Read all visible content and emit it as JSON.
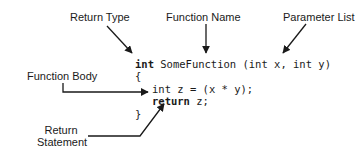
{
  "labels": {
    "return_type": "Return Type",
    "function_name": "Function Name",
    "parameter_list": "Parameter List",
    "function_body": "Function Body",
    "return_statement_line1": "Return",
    "return_statement_line2": "Statement"
  },
  "code": {
    "line1_keyword": "int",
    "line1_rest": " SomeFunction (int x, int y)",
    "line2": "{",
    "line3": "int z = (x * y);",
    "line4_keyword": "return",
    "line4_rest": " z;",
    "line5": "}"
  },
  "colors": {
    "ink": "#1a1a1a",
    "background": "#ffffff"
  }
}
